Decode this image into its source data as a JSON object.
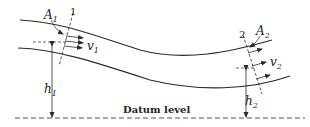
{
  "diagram": {
    "section1": {
      "number": "1",
      "area": "A",
      "area_sub": "1",
      "velocity": "v",
      "velocity_sub": "1",
      "height": "h",
      "height_sub": "1"
    },
    "section2": {
      "number": "2",
      "area": "A",
      "area_sub": "2",
      "velocity": "v",
      "velocity_sub": "2",
      "height": "h",
      "height_sub": "2"
    },
    "datum_label": "Datum level",
    "colors": {
      "line": "#2a2a2a",
      "background": "#ffffff"
    }
  }
}
